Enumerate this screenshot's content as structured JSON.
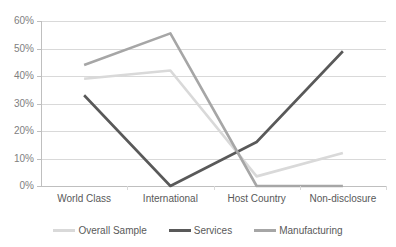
{
  "chart_data": {
    "type": "line",
    "title": "",
    "subtitle": "",
    "xlabel": "",
    "ylabel": "",
    "categories": [
      "World Class",
      "International",
      "Host Country",
      "Non-disclosure"
    ],
    "ylim": [
      0,
      60
    ],
    "ytick_labels": [
      "0%",
      "10%",
      "20%",
      "30%",
      "40%",
      "50%",
      "60%"
    ],
    "ytick_values": [
      0,
      10,
      20,
      30,
      40,
      50,
      60
    ],
    "grid": true,
    "legend_position": "bottom",
    "series": [
      {
        "name": "Overall Sample",
        "color": "#d9d9d9",
        "values": [
          39,
          42,
          3.5,
          12
        ]
      },
      {
        "name": "Services",
        "color": "#595959",
        "values": [
          33,
          0,
          16,
          49
        ]
      },
      {
        "name": "Manufacturing",
        "color": "#a6a6a6",
        "values": [
          44,
          55.5,
          0,
          0
        ]
      }
    ]
  },
  "axis": {
    "y_ticks": [
      {
        "label": "60%",
        "value": 60
      },
      {
        "label": "50%",
        "value": 50
      },
      {
        "label": "40%",
        "value": 40
      },
      {
        "label": "30%",
        "value": 30
      },
      {
        "label": "20%",
        "value": 20
      },
      {
        "label": "10%",
        "value": 10
      },
      {
        "label": "0%",
        "value": 0
      }
    ],
    "x_ticks": [
      {
        "label": "World Class"
      },
      {
        "label": "International"
      },
      {
        "label": "Host Country"
      },
      {
        "label": "Non-disclosure"
      }
    ]
  },
  "legend": {
    "items": [
      {
        "label": "Overall Sample",
        "color": "#d9d9d9"
      },
      {
        "label": "Services",
        "color": "#595959"
      },
      {
        "label": "Manufacturing",
        "color": "#a6a6a6"
      }
    ]
  },
  "colors": {
    "gridline": "#d9d9d9",
    "axis": "#bfbfbf",
    "text": "#595959",
    "tick_text": "#808080",
    "background": "#ffffff"
  }
}
